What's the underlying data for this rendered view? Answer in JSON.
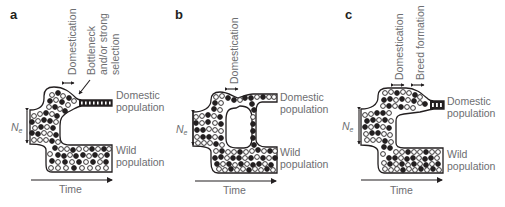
{
  "figure": {
    "panels": [
      {
        "letter": "a",
        "scenario": "Domestication followed by bottleneck and/or strong selection",
        "top_labels": [
          "Domestication",
          "Bottleneck",
          "and/or strong",
          "selection"
        ],
        "domestic_label": [
          "Domestic",
          "population"
        ],
        "wild_label": [
          "Wild",
          "population"
        ],
        "ne_label": "N",
        "ne_subscript": "e",
        "time_label": "Time"
      },
      {
        "letter": "b",
        "scenario": "Domestication with ongoing gene flow between domestic and wild populations",
        "top_labels": [
          "Domestication"
        ],
        "domestic_label": [
          "Domestic",
          "population"
        ],
        "wild_label": [
          "Wild",
          "population"
        ],
        "ne_label": "N",
        "ne_subscript": "e",
        "time_label": "Time"
      },
      {
        "letter": "c",
        "scenario": "Domestication followed by breed formation",
        "top_labels": [
          "Domestication",
          "Breed formation"
        ],
        "domestic_label": [
          "Domestic",
          "population"
        ],
        "wild_label": [
          "Wild",
          "population"
        ],
        "ne_label": "N",
        "ne_subscript": "e",
        "time_label": "Time"
      }
    ],
    "legend_semantics": {
      "open_circle": "allele variant 1",
      "filled_circle": "allele variant 2"
    },
    "colors": {
      "line": "#231f20",
      "label_text": "#6d6e71",
      "background": "#ffffff"
    }
  }
}
